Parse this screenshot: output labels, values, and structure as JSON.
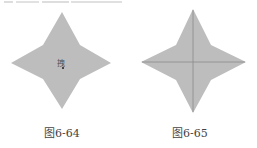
{
  "figures": [
    {
      "id": "left",
      "caption": "图6-64",
      "fill": "#bdbdbd",
      "cursor_glyph": "拽"
    },
    {
      "id": "right",
      "caption": "图6-65",
      "fill": "#bdbdbd",
      "crease_color": "#8a8a8a"
    }
  ]
}
